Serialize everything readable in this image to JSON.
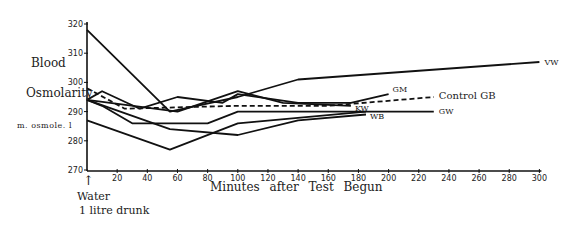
{
  "chart_data": {
    "type": "line",
    "title": "",
    "ylabel": "Blood Osmolarity",
    "ylabel_units": "m. osmole. l",
    "xlabel": "Minutes after Test Begun",
    "x_annotation": "Water 1 litre drunk",
    "xlim": [
      0,
      300
    ],
    "ylim": [
      270,
      320
    ],
    "x_ticks": [
      20,
      40,
      60,
      80,
      100,
      120,
      140,
      160,
      180,
      200,
      220,
      240,
      260,
      280,
      300
    ],
    "y_ticks": [
      270,
      280,
      290,
      300,
      310,
      320
    ],
    "grid": false,
    "legend": "inline labels at line ends",
    "series": [
      {
        "name": "VW",
        "style": "solid",
        "x": [
          0,
          55,
          100,
          140,
          300
        ],
        "y": [
          318,
          290,
          295,
          301,
          307
        ]
      },
      {
        "name": "GM",
        "style": "solid",
        "x": [
          0,
          10,
          35,
          60,
          90,
          100,
          140,
          175,
          200
        ],
        "y": [
          294,
          297,
          291,
          295,
          293,
          296,
          293,
          293,
          296
        ]
      },
      {
        "name": "KW",
        "style": "solid",
        "x": [
          0,
          60,
          100,
          130,
          175
        ],
        "y": [
          294,
          290,
          297,
          293,
          292
        ]
      },
      {
        "name": "Control GB",
        "style": "dashed",
        "x": [
          0,
          25,
          100,
          160,
          230
        ],
        "y": [
          298,
          291,
          292,
          292,
          295
        ]
      },
      {
        "name": "GW",
        "style": "solid",
        "x": [
          0,
          10,
          30,
          80,
          100,
          190,
          230
        ],
        "y": [
          294,
          292,
          286,
          286,
          290,
          290,
          290
        ]
      },
      {
        "name": "WB",
        "style": "solid",
        "x": [
          0,
          55,
          100,
          185
        ],
        "y": [
          287,
          277,
          286,
          290
        ]
      },
      {
        "name": "",
        "style": "solid",
        "x": [
          0,
          55,
          100,
          140,
          185
        ],
        "y": [
          294,
          284,
          282,
          287,
          289
        ]
      }
    ]
  },
  "labels": {
    "blood": "Blood",
    "osmolarity": "Osmolarity",
    "units": "m. osmole. l",
    "xlabel": "Minutes after Test Begun",
    "water": "Water",
    "litre": "1 litre drunk",
    "arrow": "↑"
  }
}
